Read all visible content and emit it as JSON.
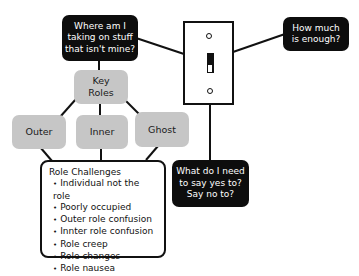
{
  "diagram": {
    "question_top_left": "Where am I taking on stuff that isn't mine?",
    "question_top_left_lines": [
      "Where am I",
      "taking on stuff",
      "that isn't mine?"
    ],
    "question_right_lines": [
      "How much",
      "is enough?"
    ],
    "question_bottom_lines": [
      "What do I need",
      "to say yes to?",
      "Say no to?"
    ],
    "center_icon": "light-switch",
    "key_roles_lines": [
      "Key",
      "Roles"
    ],
    "roles": [
      {
        "label": "Outer"
      },
      {
        "label": "Inner"
      },
      {
        "label": "Ghost"
      }
    ],
    "challenges": {
      "title": "Role Challenges",
      "items": [
        "Individual not the role",
        "Poorly occupied",
        "Outer role confusion",
        "Innter role confusion",
        "Role creep",
        "Role changes",
        "Role nausea"
      ]
    },
    "colors": {
      "dark_box": "#0d0d0d",
      "gray_box": "#c6c6c6",
      "line": "#111111",
      "background": "#ffffff"
    }
  }
}
